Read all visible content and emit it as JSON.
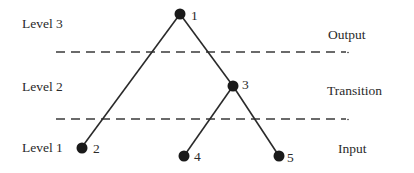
{
  "diagram": {
    "type": "hierarchy-tree",
    "left_labels": {
      "level3": "Level 3",
      "level2": "Level 2",
      "level1": "Level 1"
    },
    "right_labels": {
      "output": "Output",
      "transition": "Transition",
      "input": "Input"
    },
    "nodes": [
      {
        "id": "1",
        "label": "1",
        "level": 3
      },
      {
        "id": "2",
        "label": "2",
        "level": 1
      },
      {
        "id": "3",
        "label": "3",
        "level": 2
      },
      {
        "id": "4",
        "label": "4",
        "level": 1
      },
      {
        "id": "5",
        "label": "5",
        "level": 1
      }
    ],
    "edges": [
      {
        "from": "1",
        "to": "2"
      },
      {
        "from": "1",
        "to": "3"
      },
      {
        "from": "3",
        "to": "4"
      },
      {
        "from": "3",
        "to": "5"
      }
    ],
    "dividers": [
      {
        "name": "output-transition-boundary",
        "style": "dashed"
      },
      {
        "name": "transition-input-boundary",
        "style": "dashed"
      }
    ],
    "colors": {
      "line": "#2a2a2a",
      "node": "#1a1a1a",
      "background": "#ffffff"
    }
  }
}
